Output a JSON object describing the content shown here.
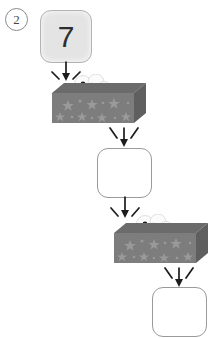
{
  "page": {
    "background": "#ffffff",
    "width": 212,
    "height": 338
  },
  "step": {
    "label": "2",
    "name": "problem-number-two"
  },
  "flow": {
    "title": "function machine chain",
    "input_label": "7",
    "boxes": [
      {
        "id": "input",
        "value": "7",
        "filled": true,
        "state": "given"
      },
      {
        "id": "middle",
        "value": "",
        "filled": false,
        "state": "blank"
      },
      {
        "id": "output",
        "value": "",
        "filled": false,
        "state": "blank"
      }
    ],
    "machines": [
      {
        "id": "machine-1",
        "rule": "",
        "decoration": "stars",
        "smoke": true
      },
      {
        "id": "machine-2",
        "rule": "",
        "decoration": "stars",
        "smoke": true
      }
    ],
    "arrows": [
      {
        "id": "arrow-in-1",
        "from": "input",
        "to": "machine-1",
        "direction": "down"
      },
      {
        "id": "arrow-out-1",
        "from": "machine-1",
        "to": "middle",
        "direction": "down"
      },
      {
        "id": "arrow-in-2",
        "from": "middle",
        "to": "machine-2",
        "direction": "down"
      },
      {
        "id": "arrow-out-2",
        "from": "machine-2",
        "to": "output",
        "direction": "down"
      }
    ]
  },
  "colors": {
    "background": "#ffffff",
    "box_outline": "#9a9a9a",
    "box_fill_given": "#e4e4e4",
    "box_fill_blank": "#ffffff",
    "machine_front": "#7d7d7d",
    "machine_top": "#6b6b6b",
    "machine_side": "#5f5f5f",
    "machine_star": "#949494",
    "smoke": "#fbfbfb",
    "arrow": "#1c1c1c",
    "digit": "#2e2e2e",
    "step_label": "#4a4a4a"
  }
}
